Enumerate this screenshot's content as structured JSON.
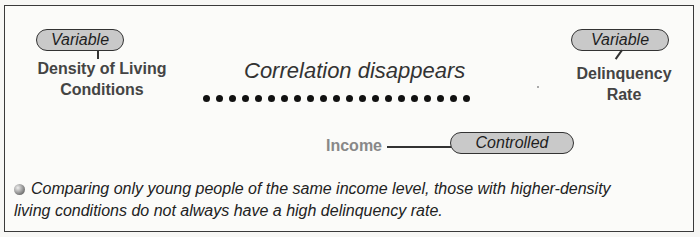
{
  "left_variable": {
    "tag": "Variable",
    "label_line1": "Density of Living",
    "label_line2": "Conditions"
  },
  "right_variable": {
    "tag": "Variable",
    "label_line1": "Delinquency",
    "label_line2": "Rate"
  },
  "relationship": {
    "text": "Correlation disappears",
    "dot_count": 21
  },
  "control": {
    "label": "Income",
    "tag": "Controlled"
  },
  "note": {
    "line1": "Comparing only young people of the same income level, those with higher-density",
    "line2": "living conditions do not always have a high delinquency rate."
  },
  "colors": {
    "pill_fill": "#c9c9c9",
    "label_text": "#444444",
    "control_label": "#888888"
  }
}
